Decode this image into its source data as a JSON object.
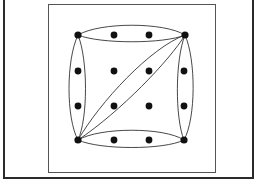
{
  "diagram": {
    "type": "hypergraph",
    "grid": {
      "cols": 4,
      "rows": 4,
      "x": [
        78,
        114,
        149,
        184
      ],
      "y": [
        35,
        71,
        106,
        140
      ]
    },
    "vertex_color": "#111111",
    "edge_color": "#333333",
    "hyperedges": [
      {
        "name": "top-row",
        "vertices": [
          [
            0,
            0
          ],
          [
            1,
            0
          ],
          [
            2,
            0
          ],
          [
            3,
            0
          ]
        ]
      },
      {
        "name": "bottom-row",
        "vertices": [
          [
            0,
            3
          ],
          [
            1,
            3
          ],
          [
            2,
            3
          ],
          [
            3,
            3
          ]
        ]
      },
      {
        "name": "left-column",
        "vertices": [
          [
            0,
            0
          ],
          [
            0,
            1
          ],
          [
            0,
            2
          ],
          [
            0,
            3
          ]
        ]
      },
      {
        "name": "right-column",
        "vertices": [
          [
            3,
            0
          ],
          [
            3,
            1
          ],
          [
            3,
            2
          ],
          [
            3,
            3
          ]
        ]
      },
      {
        "name": "anti-diagonal",
        "vertices": [
          [
            0,
            3
          ],
          [
            3,
            0
          ]
        ]
      }
    ]
  }
}
